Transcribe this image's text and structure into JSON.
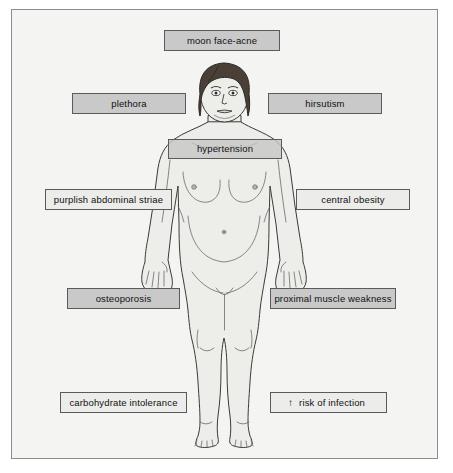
{
  "figure": {
    "background_color": "#f4f4f2",
    "frame_color": "#8d8d8d",
    "label_fill": "#c9c9c9",
    "label_fill_pale": "#ececeb",
    "label_border": "#5a5a5a",
    "body_outline_color": "#3a3a3a",
    "body_fill_color": "#ededea",
    "hair_color": "#4a4038"
  },
  "labels": [
    {
      "id": "moon-face-acne",
      "text": "moon face-acne"
    },
    {
      "id": "plethora",
      "text": "plethora"
    },
    {
      "id": "hirsutism",
      "text": "hirsutism"
    },
    {
      "id": "hypertension",
      "text": "hypertension"
    },
    {
      "id": "purplish-abdominal-striae",
      "text": "purplish abdominal striae"
    },
    {
      "id": "central-obesity",
      "text": "central obesity"
    },
    {
      "id": "osteoporosis",
      "text": "osteoporosis"
    },
    {
      "id": "proximal-muscle-weakness",
      "text": "proximal muscle weakness"
    },
    {
      "id": "carbohydrate-intolerance",
      "text": "carbohydrate intolerance"
    },
    {
      "id": "risk-of-infection",
      "text": "risk of infection",
      "prefix": "↑"
    }
  ]
}
